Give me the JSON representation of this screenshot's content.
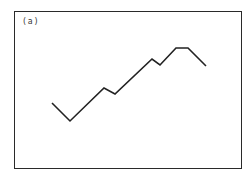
{
  "panel": {
    "label": "(a)",
    "frame": {
      "left": 14,
      "top": 11,
      "right": 242,
      "bottom": 169
    },
    "line_color": "#222222",
    "polyline": [
      [
        52,
        103
      ],
      [
        70,
        121
      ],
      [
        104,
        88
      ],
      [
        115,
        94
      ],
      [
        152,
        59
      ],
      [
        160,
        65
      ],
      [
        176,
        48
      ],
      [
        188,
        48
      ],
      [
        206,
        66
      ]
    ]
  }
}
